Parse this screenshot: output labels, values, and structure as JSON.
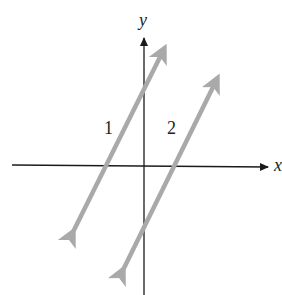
{
  "axes": {
    "x_label": "x",
    "y_label": "y"
  },
  "lines": [
    {
      "label": "1",
      "x1": 68,
      "y1": 242,
      "x2": 170,
      "y2": 38
    },
    {
      "label": "2",
      "x1": 118,
      "y1": 280,
      "x2": 222,
      "y2": 68
    }
  ],
  "colors": {
    "axis": "#1a1a1a",
    "line": "#a9a9a9"
  }
}
